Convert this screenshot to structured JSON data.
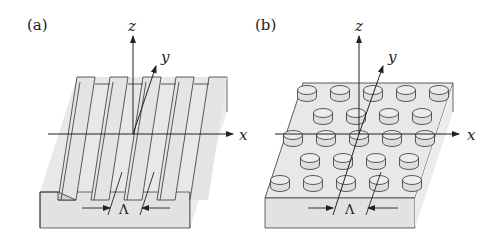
{
  "figure": {
    "panels": [
      {
        "id": "a",
        "label": "(a)",
        "structure": "1D grating (parallel ridges along y)",
        "axes": {
          "x": "x",
          "y": "y",
          "z": "z"
        },
        "period_label": "Λ",
        "ridge_count": 5
      },
      {
        "id": "b",
        "label": "(b)",
        "structure": "2D array of cylindrical pillars",
        "axes": {
          "x": "x",
          "y": "y",
          "z": "z"
        },
        "period_label": "Λ",
        "pillar_rows": [
          5,
          4,
          5,
          4,
          5
        ]
      }
    ],
    "colors": {
      "surface": "#e6e6e6",
      "side": "#dcdcdc",
      "line": "#333333",
      "background": "#ffffff"
    }
  }
}
